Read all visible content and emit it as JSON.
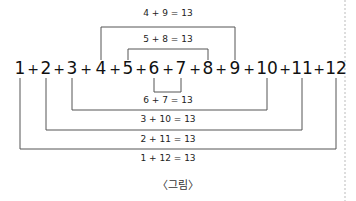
{
  "figure": {
    "caption": "〈그림〉",
    "numbers": [
      "1",
      "2",
      "3",
      "4",
      "5",
      "6",
      "7",
      "8",
      "9",
      "10",
      "11",
      "12"
    ],
    "operator": "+",
    "pairs": [
      {
        "a": 4,
        "b": 9,
        "label": "4 + 9 = 13",
        "position": "above"
      },
      {
        "a": 5,
        "b": 8,
        "label": "5 + 8 = 13",
        "position": "above"
      },
      {
        "a": 6,
        "b": 7,
        "label": "6 + 7 = 13",
        "position": "below"
      },
      {
        "a": 3,
        "b": 10,
        "label": "3 + 10 = 13",
        "position": "below"
      },
      {
        "a": 2,
        "b": 11,
        "label": "2 + 11 = 13",
        "position": "below"
      },
      {
        "a": 1,
        "b": 12,
        "label": "1 + 12 = 13",
        "position": "below"
      }
    ],
    "line_color": "#555555"
  }
}
